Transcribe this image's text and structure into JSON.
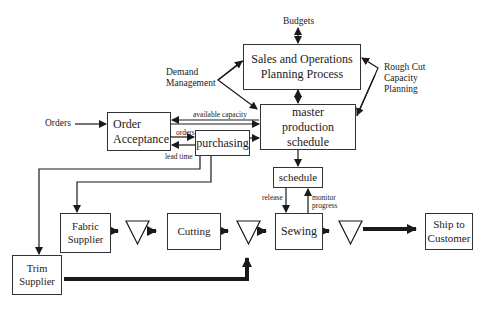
{
  "diagram": {
    "top_labels": {
      "budgets": "Budgets",
      "demand_management": "Demand\nManagement",
      "rough_cut": "Rough Cut\nCapacity\nPlanning",
      "orders": "Orders"
    },
    "boxes": {
      "sop": "Sales and Operations\nPlanning Process",
      "mps": "master\nproduction\nschedule",
      "order_acceptance": "Order\nAcceptance",
      "purchasing": "purchasing",
      "schedule": "schedule",
      "fabric_supplier": "Fabric\nSupplier",
      "cutting": "Cutting",
      "sewing": "Sewing",
      "ship_to_customer": "Ship to\nCustomer",
      "trim_supplier": "Trim\nSupplier"
    },
    "flow_labels": {
      "available_capacity": "available capacity",
      "orders": "orders",
      "lead_time": "lead time",
      "release": "release",
      "monitor_progress": "monitor\nprogress"
    },
    "colors": {
      "line": "#1a1a1a",
      "box_border": "#333333",
      "background": "#ffffff"
    }
  }
}
